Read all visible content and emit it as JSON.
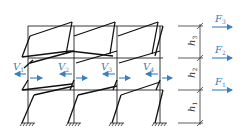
{
  "diagram": {
    "colors": {
      "frame": "#222222",
      "force": "#3a7fc0",
      "dimension": "#333333"
    },
    "forces": [
      {
        "symbol": "F",
        "sub": "3",
        "y": 27
      },
      {
        "symbol": "F",
        "sub": "2",
        "y": 58
      },
      {
        "symbol": "F",
        "sub": "1",
        "y": 90
      }
    ],
    "shears": [
      {
        "symbol": "V",
        "sub": "1",
        "x": 14
      },
      {
        "symbol": "V",
        "sub": "2",
        "x": 58
      },
      {
        "symbol": "V",
        "sub": "3",
        "x": 101
      },
      {
        "symbol": "V",
        "sub": "4",
        "x": 143
      }
    ],
    "heights": [
      {
        "symbol": "h",
        "sub": "3"
      },
      {
        "symbol": "h",
        "sub": "2"
      },
      {
        "symbol": "h",
        "sub": "1"
      }
    ],
    "columns_x": [
      28,
      74,
      117,
      160
    ],
    "floors_y": [
      26,
      58,
      90,
      123
    ]
  }
}
